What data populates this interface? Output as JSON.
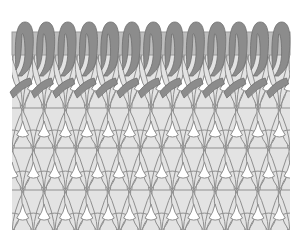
{
  "diagram": {
    "colors": {
      "background": "#ffffff",
      "fabric_fill": "#e3e3e3",
      "fabric_stroke": "#8f8f8f",
      "loop_dark": "#8c8c8c",
      "loop_dark_stroke": "#6f6f6f",
      "bar_fill": "#bdbdbd",
      "bar_stroke": "#9a9a9a",
      "gap_fill": "#ffffff"
    },
    "loops_count": 13,
    "stitch_rows": 4
  }
}
